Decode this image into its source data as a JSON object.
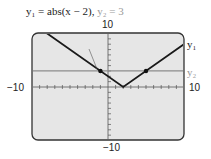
{
  "title": {
    "y1_label": "y₁ = abs(x − 2),",
    "y2_label": "y₂ = 3"
  },
  "window": {
    "ymax_label": "10",
    "ymin_label": "−10",
    "xmin_label": "−10",
    "xmax_label": "10"
  },
  "annotations": {
    "point1": "(−1, 3)",
    "point2": "(5, 3)",
    "curve1": "y₁",
    "curve2": "y₂"
  },
  "colors": {
    "screen_bg": "#e6e6e6",
    "frame": "#333333",
    "curve1": "#1a1a1a",
    "curve2": "#8c8c8c"
  },
  "chart_data": {
    "type": "line",
    "xlabel": "",
    "ylabel": "",
    "xlim": [
      -10,
      10
    ],
    "ylim": [
      -10,
      10
    ],
    "grid": false,
    "series": [
      {
        "name": "y1",
        "expression": "abs(x - 2)",
        "x": [
          -10,
          2,
          10
        ],
        "y": [
          12,
          0,
          8
        ]
      },
      {
        "name": "y2",
        "expression": "3",
        "x": [
          -10,
          10
        ],
        "y": [
          3,
          3
        ]
      }
    ],
    "points": [
      {
        "label": "(-1, 3)",
        "x": -1,
        "y": 3
      },
      {
        "label": "(5, 3)",
        "x": 5,
        "y": 3
      }
    ],
    "tick_spacing": 1
  }
}
